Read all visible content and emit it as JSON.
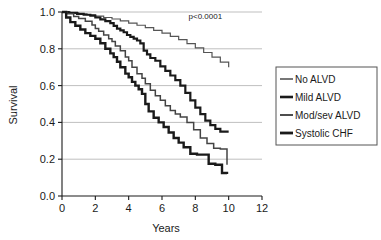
{
  "chart_data": {
    "type": "line",
    "title": "",
    "subtitle": "",
    "xlabel": "Years",
    "ylabel": "Survival",
    "xlim": [
      0,
      12
    ],
    "ylim": [
      0,
      1.0
    ],
    "xticks": [
      "0",
      "2",
      "4",
      "6",
      "8",
      "10",
      "12"
    ],
    "xtick_values": [
      0,
      2,
      4,
      6,
      8,
      10,
      12
    ],
    "yticks": [
      "0.0",
      "0.2",
      "0.4",
      "0.6",
      "0.8",
      "1.0"
    ],
    "ytick_values": [
      0,
      0.2,
      0.4,
      0.6,
      0.8,
      1.0
    ],
    "grid": "horizontal",
    "legend_position": "right-outside",
    "annotations": [
      {
        "text": "p<0.0001",
        "x": 8.6,
        "y": 0.96
      }
    ],
    "step_style": "post",
    "series": [
      {
        "name": "No ALVD",
        "color": "#555555",
        "line_width": 1.2,
        "x": [
          0,
          0.5,
          1.0,
          1.5,
          2.0,
          2.5,
          3.0,
          3.5,
          4.0,
          4.5,
          5.0,
          5.5,
          6.0,
          6.5,
          7.0,
          7.5,
          8.0,
          8.5,
          9.0,
          9.5,
          10.0
        ],
        "y": [
          1.0,
          0.995,
          0.99,
          0.985,
          0.978,
          0.97,
          0.962,
          0.952,
          0.94,
          0.928,
          0.915,
          0.9,
          0.885,
          0.868,
          0.85,
          0.828,
          0.805,
          0.78,
          0.755,
          0.728,
          0.7
        ]
      },
      {
        "name": "Mild ALVD",
        "color": "#1a1a1a",
        "line_width": 2.2,
        "x": [
          0,
          0.4,
          0.9,
          1.3,
          1.7,
          2.0,
          2.3,
          2.6,
          2.9,
          3.1,
          3.3,
          3.5,
          3.7,
          3.9,
          4.1,
          4.3,
          4.5,
          4.7,
          4.9,
          5.1,
          5.3,
          5.6,
          5.9,
          6.2,
          6.5,
          6.8,
          7.1,
          7.4,
          7.7,
          8.0,
          8.3,
          8.6,
          8.9,
          9.2,
          9.5,
          10.0
        ],
        "y": [
          1.0,
          0.995,
          0.99,
          0.985,
          0.98,
          0.97,
          0.96,
          0.95,
          0.94,
          0.925,
          0.91,
          0.9,
          0.89,
          0.875,
          0.865,
          0.855,
          0.845,
          0.83,
          0.79,
          0.77,
          0.75,
          0.735,
          0.705,
          0.68,
          0.655,
          0.63,
          0.6,
          0.56,
          0.52,
          0.48,
          0.445,
          0.41,
          0.385,
          0.365,
          0.35,
          0.35
        ]
      },
      {
        "name": "Mod/sev ALVD",
        "color": "#444444",
        "line_width": 1.5,
        "x": [
          0,
          0.3,
          0.7,
          1.0,
          1.4,
          1.8,
          2.0,
          2.2,
          2.5,
          2.8,
          3.0,
          3.2,
          3.5,
          3.8,
          4.0,
          4.2,
          4.5,
          4.8,
          5.0,
          5.3,
          5.6,
          5.9,
          6.2,
          6.5,
          6.8,
          7.1,
          7.5,
          7.9,
          8.3,
          8.7,
          9.1,
          9.5,
          9.9
        ],
        "y": [
          1.0,
          0.99,
          0.975,
          0.965,
          0.95,
          0.93,
          0.91,
          0.895,
          0.875,
          0.855,
          0.84,
          0.815,
          0.79,
          0.755,
          0.735,
          0.7,
          0.665,
          0.64,
          0.61,
          0.575,
          0.545,
          0.52,
          0.49,
          0.465,
          0.445,
          0.43,
          0.4,
          0.36,
          0.315,
          0.285,
          0.26,
          0.255,
          0.17
        ]
      },
      {
        "name": "Systolic CHF",
        "color": "#1a1a1a",
        "line_width": 2.4,
        "x": [
          0,
          0.25,
          0.5,
          0.8,
          1.1,
          1.4,
          1.7,
          2.0,
          2.3,
          2.6,
          2.9,
          3.1,
          3.3,
          3.5,
          3.8,
          4.0,
          4.2,
          4.4,
          4.6,
          4.8,
          5.0,
          5.2,
          5.5,
          5.8,
          6.1,
          6.4,
          6.7,
          7.0,
          7.3,
          7.7,
          8.1,
          8.5,
          8.8,
          9.2,
          9.6,
          9.9
        ],
        "y": [
          1.0,
          0.97,
          0.945,
          0.925,
          0.905,
          0.885,
          0.87,
          0.855,
          0.83,
          0.8,
          0.775,
          0.755,
          0.73,
          0.7,
          0.665,
          0.645,
          0.62,
          0.6,
          0.58,
          0.555,
          0.5,
          0.46,
          0.425,
          0.4,
          0.375,
          0.345,
          0.315,
          0.29,
          0.265,
          0.23,
          0.225,
          0.225,
          0.175,
          0.17,
          0.125,
          0.12
        ]
      }
    ]
  },
  "legend": {
    "items": [
      {
        "label": "No ALVD"
      },
      {
        "label": "Mild ALVD"
      },
      {
        "label": "Mod/sev ALVD"
      },
      {
        "label": "Systolic CHF"
      }
    ]
  },
  "colors": {
    "axis": "#1a1a1a",
    "grid": "#b8b8b8",
    "legend_border": "#555555",
    "background": "#ffffff"
  }
}
